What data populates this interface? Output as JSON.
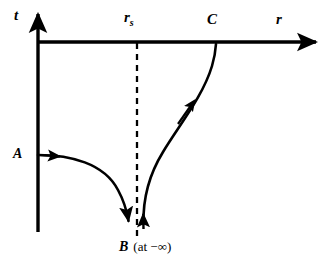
{
  "figure": {
    "type": "spacetime-diagram",
    "background_color": "#ffffff",
    "stroke_color": "#000000",
    "axes": {
      "vertical": {
        "label": "t",
        "x": 38,
        "top": 8,
        "bottom": 232
      },
      "horizontal": {
        "label": "r",
        "y": 42,
        "left": 38,
        "right": 322
      }
    },
    "markers": {
      "schwarzschild_radius": {
        "label": "r",
        "subscript": "s",
        "x": 137,
        "style": "dashed-vertical"
      },
      "point_a": {
        "label": "A",
        "x": 38,
        "y": 155
      },
      "point_b": {
        "label": "B",
        "note": "(at −∞)",
        "x": 136,
        "y": 232
      },
      "point_c": {
        "label": "C",
        "x": 216,
        "y": 42
      }
    },
    "curves": [
      {
        "name": "infalling-worldline-A-to-B",
        "from": "A",
        "to": "B",
        "direction_arrows": [
          "right-near-start",
          "down-at-end"
        ]
      },
      {
        "name": "outgoing-worldline-B-to-C",
        "from": "B",
        "to": "C",
        "direction_arrows": [
          "up-at-start",
          "up-right-midway"
        ]
      }
    ]
  },
  "labels": {
    "axis_t": "t",
    "axis_r": "r",
    "rs_base": "r",
    "rs_sub": "s",
    "point_a": "A",
    "point_b": "B",
    "point_b_note": "(at −∞)",
    "point_c": "C"
  }
}
